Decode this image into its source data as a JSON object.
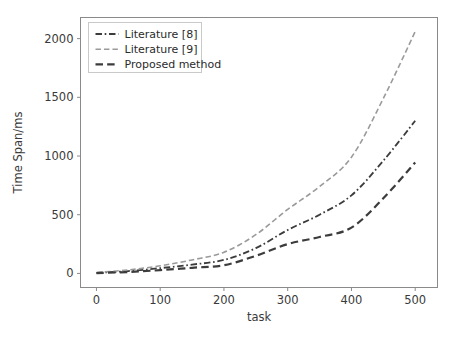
{
  "chart_data": {
    "type": "line",
    "title": "",
    "xlabel": "task",
    "ylabel": "Time Span/ms",
    "xlim": [
      -25,
      535
    ],
    "ylim": [
      -120,
      2180
    ],
    "xticks": [
      0,
      100,
      200,
      300,
      400,
      500
    ],
    "yticks": [
      0,
      500,
      1000,
      1500,
      2000
    ],
    "xticklabels": [
      "0",
      "100",
      "200",
      "300",
      "400",
      "500"
    ],
    "yticklabels": [
      "0",
      "500",
      "1000",
      "1500",
      "2000"
    ],
    "grid": false,
    "legend_position": "upper left",
    "x": [
      0,
      50,
      100,
      150,
      200,
      250,
      300,
      350,
      400,
      450,
      500
    ],
    "series": [
      {
        "name": "Literature [8]",
        "label": "Literature [8]",
        "linestyle": "dashdot",
        "color": "#3c3c3c",
        "linewidth": 1.8,
        "values": [
          5,
          20,
          45,
          75,
          115,
          215,
          370,
          500,
          665,
          960,
          1300
        ]
      },
      {
        "name": "Literature [9]",
        "label": "Literature [9]",
        "linestyle": "dashed",
        "color": "#9a9a9a",
        "linewidth": 1.6,
        "values": [
          8,
          30,
          65,
          115,
          180,
          330,
          545,
          740,
          990,
          1490,
          2060
        ]
      },
      {
        "name": "Proposed method",
        "label": "Proposed method",
        "linestyle": "dashed",
        "color": "#3c3c3c",
        "linewidth": 2.2,
        "values": [
          3,
          12,
          28,
          48,
          70,
          150,
          250,
          310,
          390,
          640,
          945
        ]
      }
    ]
  },
  "legend": {
    "entries": [
      {
        "label": "Literature [8]"
      },
      {
        "label": "Literature [9]"
      },
      {
        "label": "Proposed method"
      }
    ]
  },
  "axes": {
    "x_axis_label": "task",
    "y_axis_label": "Time Span/ms"
  }
}
